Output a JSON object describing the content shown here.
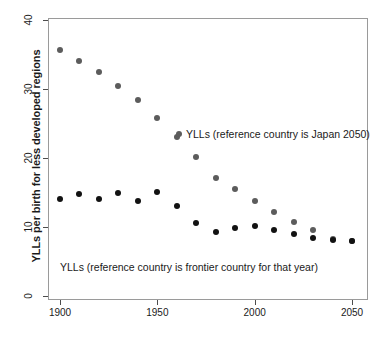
{
  "chart_data": {
    "type": "scatter",
    "title": "",
    "subtitle": "",
    "xlabel": "",
    "ylabel": "YLLs per birth for less developed regions",
    "xlim": [
      1895,
      2055
    ],
    "ylim": [
      0,
      41
    ],
    "xticks": [
      1900,
      1950,
      2000,
      2050
    ],
    "yticks": [
      0,
      10,
      20,
      30,
      40
    ],
    "grid": false,
    "legend_position": "inline-annotations",
    "x": [
      1900,
      1910,
      1920,
      1930,
      1940,
      1950,
      1960,
      1970,
      1980,
      1990,
      2000,
      2010,
      2020,
      2030,
      2040,
      2050
    ],
    "series": [
      {
        "name": "YLLs (reference country is Japan 2050)",
        "color": "#5c5c5c",
        "values": [
          35.7,
          34.1,
          32.4,
          30.5,
          28.4,
          25.8,
          23.0,
          20.1,
          17.1,
          15.5,
          13.8,
          12.2,
          10.7,
          9.5,
          8.2,
          7.9
        ]
      },
      {
        "name": "YLLs (reference country is frontier country for that year)",
        "color": "#121212",
        "values": [
          14.0,
          14.8,
          14.0,
          14.9,
          13.8,
          15.1,
          13.0,
          10.6,
          9.3,
          9.8,
          10.2,
          9.5,
          9.0,
          8.4,
          8.1,
          7.9
        ]
      }
    ],
    "annotations": [
      {
        "id": "annot-japan",
        "text": "YLLs (reference country is Japan 2050)"
      },
      {
        "id": "annot-frontier",
        "text": "YLLs (reference country is frontier country for that year)"
      }
    ]
  },
  "axis": {
    "y_title": "YLLs per birth for less developed regions",
    "y_tick_labels": [
      "0",
      "10",
      "20",
      "30",
      "40"
    ],
    "x_tick_labels": [
      "1900",
      "1950",
      "2000",
      "2050"
    ]
  },
  "annotations": {
    "japan": "YLLs (reference country is Japan 2050)",
    "frontier": "YLLs (reference country is frontier country for that year)"
  },
  "colors": {
    "japan_series": "#5c5c5c",
    "frontier_series": "#121212",
    "frame": "#9a9a9a",
    "background": "#ffffff"
  }
}
